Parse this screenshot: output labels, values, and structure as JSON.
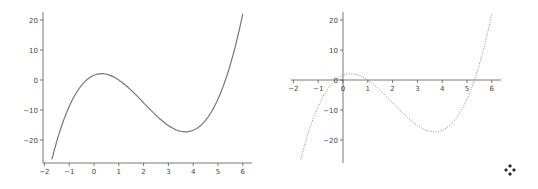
{
  "chart_data": [
    {
      "type": "line",
      "title": "",
      "xlabel": "",
      "ylabel": "",
      "xlim": [
        -2.05,
        6.35
      ],
      "ylim": [
        -28,
        22
      ],
      "x_ticks": [
        -2,
        -1,
        0,
        1,
        2,
        3,
        4,
        5,
        6
      ],
      "y_ticks": [
        -20,
        -10,
        0,
        10,
        20
      ],
      "grid": false,
      "spines": "left-bottom",
      "line_style": "solid",
      "line_color": "#777777",
      "series": [
        {
          "name": "cubic",
          "x": [
            -1.7,
            -1.5,
            -1,
            -0.5,
            0,
            0.3,
            0.5,
            1,
            1.5,
            2,
            2.5,
            3,
            3.5,
            3.7,
            4,
            4.5,
            5,
            5.5,
            6
          ],
          "values": [
            -26.5,
            -21.6,
            -8.8,
            -1.0,
            1.6,
            2.1,
            1.9,
            0,
            -3.1,
            -7.6,
            -11.8,
            -15.2,
            -17.2,
            -17.3,
            -16.8,
            -13.4,
            -6.4,
            4.2,
            22.1
          ]
        }
      ]
    },
    {
      "type": "line",
      "title": "",
      "xlabel": "",
      "ylabel": "",
      "xlim": [
        -2.05,
        6.35
      ],
      "ylim": [
        -28,
        22
      ],
      "x_ticks": [
        -2,
        -1,
        0,
        1,
        2,
        3,
        4,
        5,
        6
      ],
      "y_ticks": [
        -20,
        -10,
        10,
        20
      ],
      "origin_tick_label": "0",
      "grid": false,
      "spines": "centered-at-origin",
      "line_style": "dotted",
      "line_color": "#888888",
      "series": [
        {
          "name": "cubic",
          "x": [
            -1.7,
            -1.5,
            -1,
            -0.5,
            0,
            0.3,
            0.5,
            1,
            1.5,
            2,
            2.5,
            3,
            3.5,
            3.7,
            4,
            4.5,
            5,
            5.5,
            6
          ],
          "values": [
            -26.5,
            -21.6,
            -8.8,
            -1.0,
            1.6,
            2.1,
            1.9,
            0,
            -3.1,
            -7.6,
            -11.8,
            -15.2,
            -17.2,
            -17.3,
            -16.8,
            -13.4,
            -6.4,
            4.2,
            22.1
          ]
        }
      ]
    }
  ],
  "left_plot": {
    "x_tick_labels": [
      "−2",
      "−1",
      "0",
      "1",
      "2",
      "3",
      "4",
      "5",
      "6"
    ],
    "y_tick_labels": [
      "20",
      "10",
      "0",
      "−10",
      "−20"
    ]
  },
  "right_plot": {
    "x_tick_labels": [
      "−2",
      "−1",
      "0",
      "1",
      "2",
      "3",
      "4",
      "5",
      "6"
    ],
    "y_tick_labels": [
      "20",
      "10",
      "0",
      "−10",
      "−20"
    ]
  },
  "icons": {
    "move": "move-arrows-icon"
  }
}
